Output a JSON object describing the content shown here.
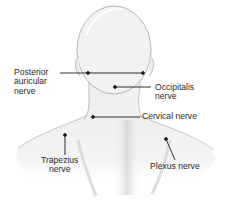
{
  "diagram": {
    "colors": {
      "skin": "#f1f1f1",
      "outline": "#b5b5b5",
      "shading": "#cfcfcf",
      "leader": "#1a1a1a",
      "text": "#2a2a2a"
    },
    "labels": [
      {
        "id": "posterior-auricular",
        "text": "Posterior\nauricular\nnerve"
      },
      {
        "id": "occipitalis",
        "text": "Occipitalis\nnerve"
      },
      {
        "id": "cervical",
        "text": "Cervical nerve"
      },
      {
        "id": "trapezius",
        "text": "Trapezius\nnerve"
      },
      {
        "id": "plexus",
        "text": "Plexus nerve"
      }
    ]
  }
}
